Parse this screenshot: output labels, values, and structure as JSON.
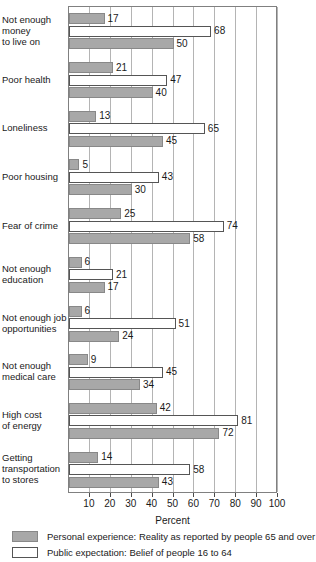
{
  "chart_data": {
    "type": "bar",
    "orientation": "horizontal",
    "title": "",
    "xlabel": "Percent",
    "ylabel": "",
    "xlim": [
      0,
      100
    ],
    "xticks": [
      10,
      20,
      30,
      40,
      50,
      60,
      70,
      80,
      90,
      100
    ],
    "grid": true,
    "legend_position": "bottom",
    "categories": [
      "Not enough\nmoney\nto live on",
      "Poor health",
      "Loneliness",
      "Poor housing",
      "Fear of crime",
      "Not enough\neducation",
      "Not enough job\nopportunities",
      "Not enough\nmedical care",
      "High cost\nof energy",
      "Getting\ntransportation\nto stores"
    ],
    "series": [
      {
        "name": "Personal experience: Reality as reported by people 65 and over",
        "color": "#a8a8a8",
        "style": "gray",
        "values": [
          17,
          21,
          13,
          5,
          25,
          6,
          6,
          9,
          42,
          14
        ]
      },
      {
        "name": "Public expectation: Belief of people 16 to 64",
        "color": "#ffffff",
        "style": "white",
        "values": [
          68,
          47,
          65,
          43,
          74,
          21,
          51,
          45,
          81,
          58
        ]
      },
      {
        "name": "Personal experience: Reality as reported by people 65 and over",
        "color": "#a8a8a8",
        "style": "gray",
        "values": [
          50,
          40,
          45,
          30,
          58,
          17,
          24,
          34,
          72,
          43
        ]
      }
    ]
  },
  "axis": {
    "title": "Percent",
    "ticks": [
      "10",
      "20",
      "30",
      "40",
      "50",
      "60",
      "70",
      "80",
      "90",
      "100"
    ]
  },
  "legend": {
    "items": [
      {
        "swatch": "gray",
        "label": "Personal experience: Reality as reported by people 65 and over"
      },
      {
        "swatch": "white",
        "label": "Public expectation: Belief of people 16 to 64"
      }
    ]
  },
  "category_labels": [
    [
      "Not enough",
      "money",
      "to live on"
    ],
    [
      "Poor health"
    ],
    [
      "Loneliness"
    ],
    [
      "Poor housing"
    ],
    [
      "Fear of crime"
    ],
    [
      "Not enough",
      "education"
    ],
    [
      "Not enough job",
      "opportunities"
    ],
    [
      "Not enough",
      "medical care"
    ],
    [
      "High cost",
      "of energy"
    ],
    [
      "Getting",
      "transportation",
      "to stores"
    ]
  ]
}
